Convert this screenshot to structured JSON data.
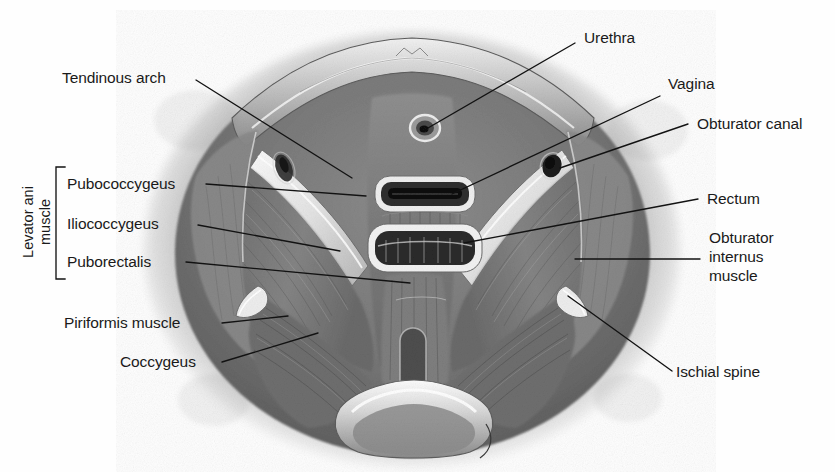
{
  "figure": {
    "background_color": "#fefefe",
    "ink_color": "#1a1a1a"
  },
  "group_bracket": {
    "label_line1": "Levator ani",
    "label_line2": "muscle",
    "members": [
      "Pubococcygeus",
      "Iliococcygeus",
      "Puborectalis"
    ]
  },
  "labels": {
    "tendinous_arch": "Tendinous arch",
    "pubococcygeus": "Pubococcygeus",
    "iliococcygeus": "Iliococcygeus",
    "puborectalis": "Puborectalis",
    "piriformis_muscle": "Piriformis muscle",
    "coccygeus": "Coccygeus",
    "urethra": "Urethra",
    "vagina": "Vagina",
    "obturator_canal": "Obturator canal",
    "rectum": "Rectum",
    "obturator_internus_line1": "Obturator",
    "obturator_internus_line2": "internus",
    "obturator_internus_line3": "muscle",
    "ischial_spine": "Ischial spine"
  },
  "structures": {
    "urethral_opening": "urethra-opening",
    "vaginal_opening": "vagina-opening",
    "rectal_opening": "rectum-opening",
    "obturator_canal_foramen": "obturator-canal-foramen",
    "coccyx_bone": "coccyx-bone",
    "pubic_arch": "pubic-arch"
  }
}
